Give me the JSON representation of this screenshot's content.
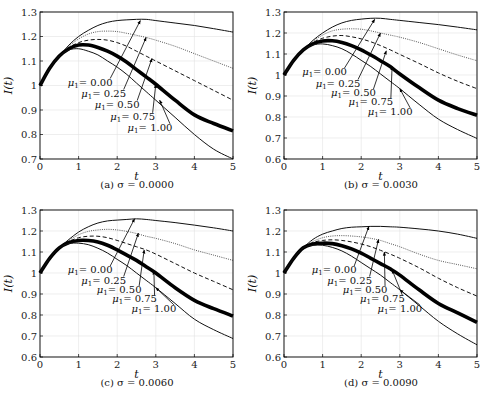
{
  "chart_data": [
    {
      "type": "line",
      "panel": "a",
      "caption": "(a) σ = 0.0000",
      "xlabel": "t",
      "ylabel": "I(t)",
      "xlim": [
        0,
        5
      ],
      "ylim": [
        0.7,
        1.3
      ],
      "xticks": [
        0,
        1,
        2,
        3,
        4,
        5
      ],
      "yticks": [
        0.7,
        0.8,
        0.9,
        1.0,
        1.1,
        1.2,
        1.3
      ],
      "ytick_labels": [
        "0.7",
        "0.8",
        "0.9",
        "1",
        "1.1",
        "1.2",
        "1.3"
      ],
      "grid": true,
      "x": [
        0,
        0.25,
        0.5,
        0.75,
        1,
        1.25,
        1.5,
        1.75,
        2,
        2.25,
        2.5,
        2.75,
        3,
        3.5,
        4,
        4.5,
        5
      ],
      "series": [
        {
          "name": "μ1 = 0.00",
          "style": "solid-thin",
          "values": [
            1.0,
            1.07,
            1.12,
            1.165,
            1.2,
            1.225,
            1.245,
            1.258,
            1.265,
            1.268,
            1.27,
            1.27,
            1.265,
            1.255,
            1.245,
            1.232,
            1.218
          ]
        },
        {
          "name": "μ1 = 0.25",
          "style": "dotted",
          "values": [
            1.0,
            1.07,
            1.12,
            1.16,
            1.19,
            1.21,
            1.22,
            1.222,
            1.22,
            1.213,
            1.205,
            1.196,
            1.185,
            1.16,
            1.13,
            1.1,
            1.07
          ]
        },
        {
          "name": "μ1 = 0.50",
          "style": "dashed",
          "values": [
            1.0,
            1.07,
            1.12,
            1.155,
            1.175,
            1.185,
            1.188,
            1.185,
            1.175,
            1.16,
            1.14,
            1.12,
            1.1,
            1.06,
            1.02,
            0.98,
            0.94
          ]
        },
        {
          "name": "μ1 = 0.75",
          "style": "solid-thick",
          "values": [
            1.0,
            1.07,
            1.12,
            1.15,
            1.165,
            1.165,
            1.155,
            1.14,
            1.12,
            1.095,
            1.065,
            1.035,
            1.005,
            0.94,
            0.88,
            0.845,
            0.815
          ]
        },
        {
          "name": "μ1 = 1.00",
          "style": "solid-thin",
          "values": [
            1.0,
            1.07,
            1.12,
            1.145,
            1.15,
            1.14,
            1.125,
            1.1,
            1.075,
            1.045,
            1.01,
            0.975,
            0.94,
            0.87,
            0.8,
            0.74,
            0.7
          ]
        }
      ],
      "annotations": [
        {
          "text": "μ1 = 0.00",
          "label_xy": [
            1.3,
            1.0
          ],
          "arrow_to": [
            2.6,
            1.265
          ]
        },
        {
          "text": "μ1 = 0.25",
          "label_xy": [
            1.65,
            0.955
          ],
          "arrow_to": [
            2.75,
            1.196
          ]
        },
        {
          "text": "μ1 = 0.50",
          "label_xy": [
            2.0,
            0.91
          ],
          "arrow_to": [
            2.9,
            1.11
          ]
        },
        {
          "text": "μ1 = 0.75",
          "label_xy": [
            2.4,
            0.86
          ],
          "arrow_to": [
            3.0,
            1.005
          ]
        },
        {
          "text": "μ1 = 1.00",
          "label_xy": [
            2.85,
            0.815
          ],
          "arrow_to": [
            3.1,
            0.94
          ]
        }
      ]
    },
    {
      "type": "line",
      "panel": "b",
      "caption": "(b) σ = 0.0030",
      "xlabel": "t",
      "ylabel": "I(t)",
      "xlim": [
        0,
        5
      ],
      "ylim": [
        0.6,
        1.3
      ],
      "xticks": [
        0,
        1,
        2,
        3,
        4,
        5
      ],
      "yticks": [
        0.6,
        0.7,
        0.8,
        0.9,
        1.0,
        1.1,
        1.2,
        1.3
      ],
      "ytick_labels": [
        "0.6",
        "0.7",
        "0.8",
        "0.9",
        "1",
        "1.1",
        "1.2",
        "1.3"
      ],
      "grid": true,
      "x": [
        0,
        0.25,
        0.5,
        0.75,
        1,
        1.25,
        1.5,
        1.75,
        2,
        2.25,
        2.5,
        2.75,
        3,
        3.5,
        4,
        4.5,
        5
      ],
      "series": [
        {
          "name": "μ1 = 0.00",
          "style": "solid-thin",
          "values": [
            1.0,
            1.07,
            1.12,
            1.165,
            1.2,
            1.228,
            1.248,
            1.26,
            1.266,
            1.27,
            1.27,
            1.265,
            1.26,
            1.25,
            1.24,
            1.228,
            1.215
          ]
        },
        {
          "name": "μ1 = 0.25",
          "style": "dotted",
          "values": [
            1.0,
            1.07,
            1.12,
            1.16,
            1.19,
            1.21,
            1.218,
            1.22,
            1.218,
            1.21,
            1.2,
            1.19,
            1.18,
            1.155,
            1.125,
            1.095,
            1.068
          ]
        },
        {
          "name": "μ1 = 0.50",
          "style": "dashed",
          "values": [
            1.0,
            1.07,
            1.12,
            1.155,
            1.175,
            1.185,
            1.188,
            1.182,
            1.172,
            1.158,
            1.14,
            1.12,
            1.098,
            1.055,
            1.01,
            0.97,
            0.935
          ]
        },
        {
          "name": "μ1 = 0.75",
          "style": "solid-thick",
          "values": [
            1.0,
            1.07,
            1.12,
            1.148,
            1.162,
            1.163,
            1.155,
            1.14,
            1.12,
            1.095,
            1.068,
            1.04,
            1.005,
            0.94,
            0.88,
            0.84,
            0.808
          ]
        },
        {
          "name": "μ1 = 1.00",
          "style": "solid-thin",
          "values": [
            1.0,
            1.07,
            1.12,
            1.143,
            1.148,
            1.14,
            1.125,
            1.1,
            1.07,
            1.04,
            1.005,
            0.97,
            0.935,
            0.86,
            0.79,
            0.74,
            0.698
          ]
        }
      ],
      "annotations": [
        {
          "text": "μ1 = 0.00",
          "label_xy": [
            1.05,
            1.0
          ],
          "arrow_to": [
            2.35,
            1.265
          ]
        },
        {
          "text": "μ1 = 0.25",
          "label_xy": [
            1.4,
            0.945
          ],
          "arrow_to": [
            2.5,
            1.2
          ]
        },
        {
          "text": "μ1 = 0.50",
          "label_xy": [
            1.8,
            0.9
          ],
          "arrow_to": [
            2.65,
            1.115
          ]
        },
        {
          "text": "μ1 = 0.75",
          "label_xy": [
            2.25,
            0.855
          ],
          "arrow_to": [
            2.8,
            1.04
          ]
        },
        {
          "text": "μ1 = 1.00",
          "label_xy": [
            2.75,
            0.81
          ],
          "arrow_to": [
            3.0,
            0.935
          ]
        }
      ]
    },
    {
      "type": "line",
      "panel": "c",
      "caption": "(c) σ = 0.0060",
      "xlabel": "t",
      "ylabel": "I(t)",
      "xlim": [
        0,
        5
      ],
      "ylim": [
        0.6,
        1.3
      ],
      "xticks": [
        0,
        1,
        2,
        3,
        4,
        5
      ],
      "yticks": [
        0.6,
        0.7,
        0.8,
        0.9,
        1.0,
        1.1,
        1.2,
        1.3
      ],
      "ytick_labels": [
        "0.6",
        "0.7",
        "0.8",
        "0.9",
        "1",
        "1.1",
        "1.2",
        "1.3"
      ],
      "grid": true,
      "x": [
        0,
        0.25,
        0.5,
        0.75,
        1,
        1.25,
        1.5,
        1.75,
        2,
        2.25,
        2.5,
        2.75,
        3,
        3.5,
        4,
        4.5,
        5
      ],
      "series": [
        {
          "name": "μ1 = 0.00",
          "style": "solid-thin",
          "values": [
            1.0,
            1.07,
            1.12,
            1.16,
            1.195,
            1.22,
            1.238,
            1.248,
            1.252,
            1.255,
            1.258,
            1.255,
            1.25,
            1.24,
            1.228,
            1.215,
            1.2
          ]
        },
        {
          "name": "μ1 = 0.25",
          "style": "dotted",
          "values": [
            1.0,
            1.07,
            1.12,
            1.155,
            1.182,
            1.198,
            1.205,
            1.208,
            1.205,
            1.198,
            1.188,
            1.175,
            1.165,
            1.14,
            1.11,
            1.085,
            1.06
          ]
        },
        {
          "name": "μ1 = 0.50",
          "style": "dashed",
          "values": [
            1.0,
            1.07,
            1.12,
            1.15,
            1.168,
            1.175,
            1.175,
            1.168,
            1.155,
            1.14,
            1.125,
            1.11,
            1.09,
            1.045,
            1.0,
            0.96,
            0.92
          ]
        },
        {
          "name": "μ1 = 0.75",
          "style": "solid-thick",
          "values": [
            1.0,
            1.07,
            1.12,
            1.145,
            1.155,
            1.155,
            1.148,
            1.132,
            1.11,
            1.085,
            1.06,
            1.03,
            1.0,
            0.93,
            0.87,
            0.83,
            0.795
          ]
        },
        {
          "name": "μ1 = 1.00",
          "style": "solid-thin",
          "values": [
            1.0,
            1.07,
            1.12,
            1.14,
            1.142,
            1.135,
            1.118,
            1.095,
            1.065,
            1.035,
            1.0,
            0.965,
            0.93,
            0.855,
            0.78,
            0.73,
            0.688
          ]
        }
      ],
      "annotations": [
        {
          "text": "μ1 = 0.00",
          "label_xy": [
            1.3,
            1.0
          ],
          "arrow_to": [
            2.45,
            1.258
          ]
        },
        {
          "text": "μ1 = 0.25",
          "label_xy": [
            1.65,
            0.95
          ],
          "arrow_to": [
            2.55,
            1.19
          ]
        },
        {
          "text": "μ1 = 0.50",
          "label_xy": [
            2.05,
            0.905
          ],
          "arrow_to": [
            2.7,
            1.11
          ]
        },
        {
          "text": "μ1 = 0.75",
          "label_xy": [
            2.45,
            0.86
          ],
          "arrow_to": [
            2.95,
            1.01
          ]
        },
        {
          "text": "μ1 = 1.00",
          "label_xy": [
            2.95,
            0.815
          ],
          "arrow_to": [
            3.0,
            0.93
          ]
        }
      ]
    },
    {
      "type": "line",
      "panel": "d",
      "caption": "(d) σ = 0.0090",
      "xlabel": "t",
      "ylabel": "I(t)",
      "xlim": [
        0,
        5
      ],
      "ylim": [
        0.6,
        1.3
      ],
      "xticks": [
        0,
        1,
        2,
        3,
        4,
        5
      ],
      "yticks": [
        0.6,
        0.7,
        0.8,
        0.9,
        1.0,
        1.1,
        1.2,
        1.3
      ],
      "ytick_labels": [
        "0.6",
        "0.7",
        "0.8",
        "0.9",
        "1",
        "1.1",
        "1.2",
        "1.3"
      ],
      "grid": true,
      "x": [
        0,
        0.25,
        0.5,
        0.75,
        1,
        1.25,
        1.5,
        1.75,
        2,
        2.25,
        2.5,
        2.75,
        3,
        3.5,
        4,
        4.5,
        5
      ],
      "series": [
        {
          "name": "μ1 = 0.00",
          "style": "solid-thin",
          "values": [
            1.0,
            1.07,
            1.12,
            1.16,
            1.185,
            1.2,
            1.212,
            1.218,
            1.22,
            1.222,
            1.222,
            1.22,
            1.218,
            1.21,
            1.2,
            1.185,
            1.165
          ]
        },
        {
          "name": "μ1 = 0.25",
          "style": "dotted",
          "values": [
            1.0,
            1.07,
            1.12,
            1.15,
            1.168,
            1.176,
            1.178,
            1.176,
            1.172,
            1.165,
            1.155,
            1.14,
            1.125,
            1.09,
            1.06,
            1.04,
            1.02
          ]
        },
        {
          "name": "μ1 = 0.50",
          "style": "dashed",
          "values": [
            1.0,
            1.07,
            1.12,
            1.145,
            1.155,
            1.158,
            1.155,
            1.148,
            1.138,
            1.125,
            1.108,
            1.09,
            1.07,
            1.025,
            0.975,
            0.93,
            0.89
          ]
        },
        {
          "name": "μ1 = 0.75",
          "style": "solid-thick",
          "values": [
            1.0,
            1.07,
            1.12,
            1.138,
            1.142,
            1.14,
            1.13,
            1.115,
            1.095,
            1.07,
            1.045,
            1.02,
            0.99,
            0.92,
            0.855,
            0.81,
            0.765
          ]
        },
        {
          "name": "μ1 = 1.00",
          "style": "solid-thin",
          "values": [
            1.0,
            1.07,
            1.12,
            1.132,
            1.132,
            1.122,
            1.105,
            1.08,
            1.05,
            1.02,
            0.99,
            0.955,
            0.92,
            0.845,
            0.77,
            0.71,
            0.658
          ]
        }
      ],
      "annotations": [
        {
          "text": "μ1 = 0.00",
          "label_xy": [
            1.3,
            1.0
          ],
          "arrow_to": [
            2.2,
            1.222
          ]
        },
        {
          "text": "μ1 = 0.25",
          "label_xy": [
            1.7,
            0.95
          ],
          "arrow_to": [
            2.45,
            1.16
          ]
        },
        {
          "text": "μ1 = 0.50",
          "label_xy": [
            2.1,
            0.905
          ],
          "arrow_to": [
            2.6,
            1.1
          ]
        },
        {
          "text": "μ1 = 0.75",
          "label_xy": [
            2.55,
            0.86
          ],
          "arrow_to": [
            2.8,
            1.015
          ]
        },
        {
          "text": "μ1 = 1.00",
          "label_xy": [
            3.0,
            0.815
          ],
          "arrow_to": [
            3.0,
            0.92
          ]
        }
      ]
    }
  ],
  "panels": [
    {
      "caption": "(a) σ = 0.0000"
    },
    {
      "caption": "(b) σ = 0.0030"
    },
    {
      "caption": "(c) σ = 0.0060"
    },
    {
      "caption": "(d) σ = 0.0090"
    }
  ]
}
